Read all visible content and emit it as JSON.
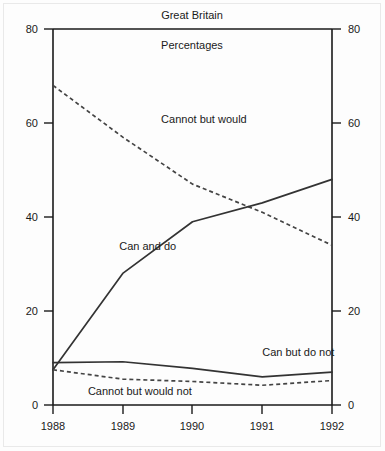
{
  "chart_data": {
    "type": "line",
    "title": "Great Britain",
    "subtitle": "Percentages",
    "xlabel": "",
    "ylabel": "",
    "x": [
      1988,
      1989,
      1990,
      1991,
      1992
    ],
    "xtick_labels": [
      "1988",
      "1989",
      "1990",
      "1991",
      "1992"
    ],
    "ytick_labels": [
      "0",
      "20",
      "40",
      "60",
      "80"
    ],
    "ytick_values": [
      0,
      20,
      40,
      60,
      80
    ],
    "ylim": [
      0,
      80
    ],
    "xlim": [
      1988,
      1992
    ],
    "grid": false,
    "legend_position": "inline-annotations",
    "dual_y_axis": true,
    "series": [
      {
        "name": "Cannot but would",
        "style": "dashed",
        "values": [
          68,
          57,
          47,
          41,
          34
        ]
      },
      {
        "name": "Can and do",
        "style": "solid",
        "values": [
          7.5,
          28,
          39,
          43,
          48
        ]
      },
      {
        "name": "Can but do not",
        "style": "solid",
        "values": [
          9,
          9.2,
          7.8,
          6,
          7
        ]
      },
      {
        "name": "Cannot but would not",
        "style": "dashed",
        "values": [
          7.5,
          5.5,
          5,
          4.2,
          5.2
        ]
      }
    ],
    "annotations": [
      {
        "text": "Cannot but would",
        "x": 1989.55,
        "y": 60
      },
      {
        "text": "Can and do",
        "x": 1988.95,
        "y": 33
      },
      {
        "text": "Can but do not",
        "x": 1991.0,
        "y": 10.5
      },
      {
        "text": "Cannot but would not",
        "x": 1988.5,
        "y": 2.2
      }
    ]
  },
  "axes": {
    "left_ticks": [
      "80",
      "60",
      "40",
      "20",
      "0"
    ],
    "right_ticks": [
      "80",
      "60",
      "40",
      "20",
      "0"
    ],
    "bottom_ticks": [
      "1988",
      "1989",
      "1990",
      "1991",
      "1992"
    ]
  }
}
